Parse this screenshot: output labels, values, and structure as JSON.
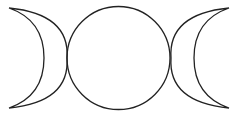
{
  "symbol": {
    "name": "triple moon",
    "stroke_color": "#222222",
    "background": "#ffffff",
    "parts": [
      {
        "id": "waxing-crescent",
        "label": "waxing crescent"
      },
      {
        "id": "full-moon",
        "label": "full moon"
      },
      {
        "id": "waning-crescent",
        "label": "waning crescent"
      }
    ]
  }
}
